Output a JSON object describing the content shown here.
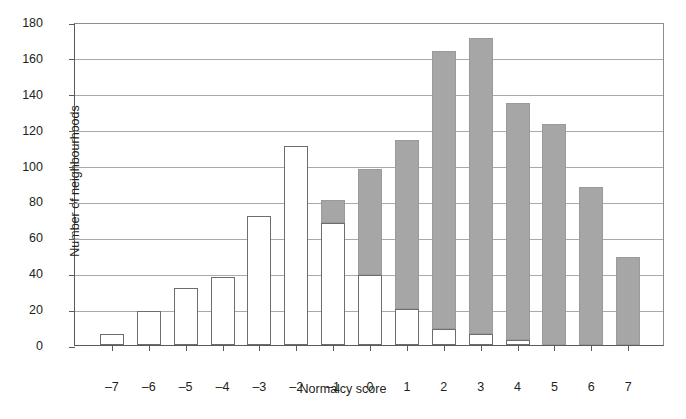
{
  "chart_data": {
    "type": "bar",
    "title": "",
    "xlabel": "Normalcy score",
    "ylabel": "Number of neighbourhoods",
    "categories": [
      "-7",
      "-6",
      "-5",
      "-4",
      "-3",
      "-2",
      "-1",
      "0",
      "1",
      "2",
      "3",
      "4",
      "5",
      "6",
      "7"
    ],
    "ylim": [
      0,
      180
    ],
    "yticks": [
      0,
      20,
      40,
      60,
      80,
      100,
      120,
      140,
      160,
      180
    ],
    "grid": true,
    "legend": "none",
    "stacked": true,
    "series": [
      {
        "name": "white",
        "color": "#ffffff",
        "values": [
          6,
          19,
          32,
          38,
          72,
          111,
          68,
          39,
          20,
          9,
          6,
          3,
          0,
          0,
          0
        ]
      },
      {
        "name": "grey",
        "color": "#a6a6a6",
        "values": [
          0,
          0,
          0,
          0,
          0,
          0,
          13,
          59,
          94,
          155,
          165,
          132,
          123,
          88,
          49
        ]
      }
    ],
    "totals": [
      6,
      19,
      32,
      38,
      72,
      111,
      81,
      98,
      114,
      164,
      171,
      135,
      123,
      88,
      49
    ]
  },
  "caption": {
    "text": "partial clipped caption line"
  }
}
